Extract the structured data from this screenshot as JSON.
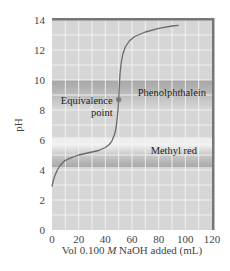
{
  "chart_data": {
    "type": "line",
    "title": "",
    "xlabel_parts": [
      "Vol 0.100 ",
      "M",
      " NaOH added (mL)"
    ],
    "xlabel": "Vol 0.100 M NaOH added (mL)",
    "ylabel": "pH",
    "xlim": [
      0,
      120
    ],
    "ylim": [
      0,
      14
    ],
    "xticks": [
      0,
      20,
      40,
      60,
      80,
      100,
      120
    ],
    "yticks": [
      0,
      2,
      4,
      6,
      8,
      10,
      12,
      14
    ],
    "grid": true,
    "series": [
      {
        "name": "Titration curve",
        "x": [
          0,
          1,
          2,
          4,
          6,
          8,
          10,
          15,
          20,
          25,
          30,
          35,
          40,
          43,
          45,
          47,
          48,
          49,
          49.5,
          50,
          50.5,
          51,
          52,
          53,
          55,
          58,
          62,
          70,
          80,
          90,
          95
        ],
        "y": [
          2.9,
          3.3,
          3.6,
          4.0,
          4.3,
          4.5,
          4.65,
          4.85,
          5.0,
          5.1,
          5.2,
          5.3,
          5.5,
          5.7,
          5.95,
          6.4,
          6.8,
          7.5,
          8.0,
          8.7,
          9.6,
          10.4,
          11.2,
          11.7,
          12.2,
          12.6,
          12.9,
          13.2,
          13.45,
          13.6,
          13.65
        ]
      }
    ],
    "indicator_bands": [
      {
        "name": "Phenolphthalein",
        "range": [
          8.2,
          10.0
        ]
      },
      {
        "name": "Methyl red",
        "range": [
          4.2,
          6.2
        ]
      }
    ],
    "annotations": [
      {
        "text_lines": [
          "Equivalence",
          "point"
        ],
        "x": 50,
        "y": 8.7
      }
    ]
  },
  "colors": {
    "plot_bg": "#d6d6d6",
    "grid": "#f4f4f4",
    "curve": "#6a6a6a",
    "point": "#7a7a7a",
    "band_dark": "#a8a8a8",
    "band_light": "#ececec",
    "frame": "#777777"
  }
}
